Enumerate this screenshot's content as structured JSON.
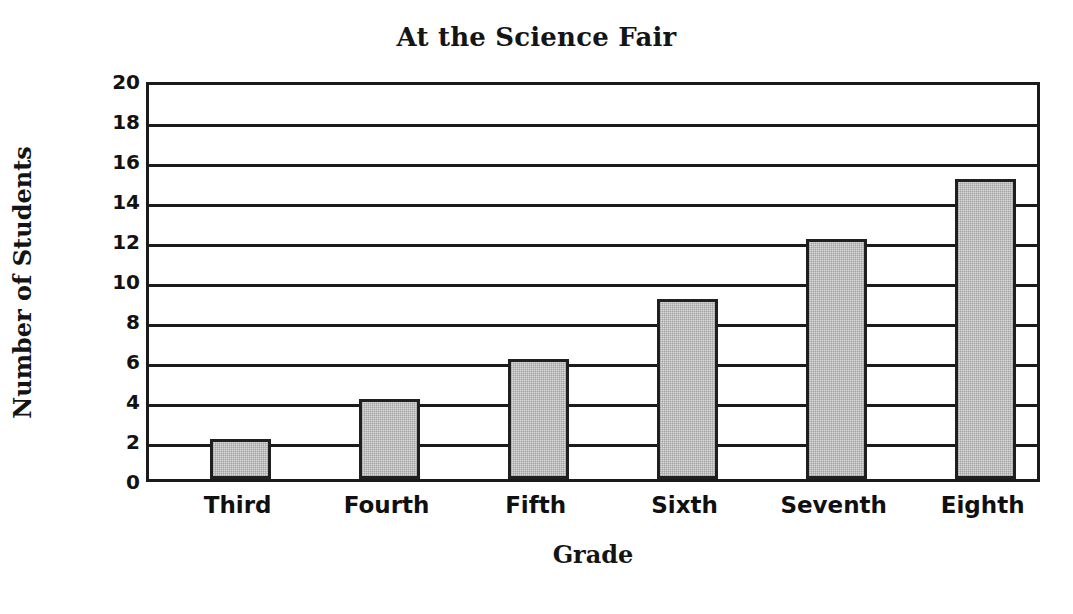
{
  "chart_data": {
    "type": "bar",
    "title": "At the Science Fair",
    "xlabel": "Grade",
    "ylabel": "Number of Students",
    "categories": [
      "Third",
      "Fourth",
      "Fifth",
      "Sixth",
      "Seventh",
      "Eighth"
    ],
    "values": [
      2,
      4,
      6,
      9,
      12,
      15
    ],
    "ylim": [
      0,
      20
    ],
    "ytick_labels": [
      "0",
      "2",
      "4",
      "6",
      "8",
      "10",
      "12",
      "14",
      "16",
      "18",
      "20"
    ],
    "ytick_values": [
      0,
      2,
      4,
      6,
      8,
      10,
      12,
      14,
      16,
      18,
      20
    ],
    "grid": "horizontal",
    "legend": "none",
    "bar_fill_color": "#d9d9d9",
    "bar_border_color": "#1f1f1f",
    "axis_color": "#1b1b1b",
    "background_color": "#ffffff"
  }
}
